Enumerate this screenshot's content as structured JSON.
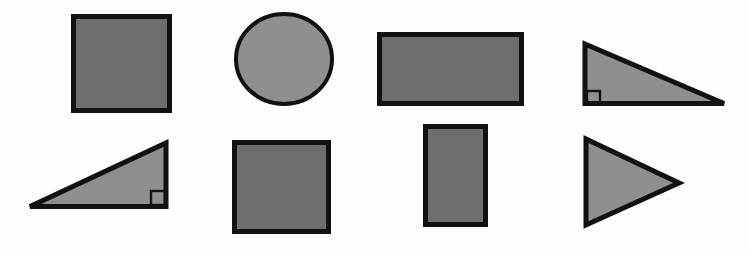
{
  "figure": {
    "background_color": "#fdfdfc",
    "outline_color": "#111111",
    "fill_color_dark": "#6e6e6e",
    "fill_color_light": "#8f8f8f",
    "rows": 2,
    "columns": 4,
    "shape_count": 8
  },
  "shapes": [
    {
      "id": "shape-1",
      "name": "square",
      "label": "Square",
      "row": 1,
      "column": 1,
      "fill": "#6e6e6e",
      "stroke": "#111111",
      "stroke_width": 5,
      "geometry": {
        "x": 71,
        "y": 14,
        "width": 101,
        "height": 99
      },
      "right_angle_marker": false
    },
    {
      "id": "shape-2",
      "name": "circle",
      "label": "Circle",
      "row": 1,
      "column": 2,
      "fill": "#8f8f8f",
      "stroke": "#111111",
      "stroke_width": 4,
      "geometry": {
        "cx": 284,
        "cy": 59,
        "rx": 50,
        "ry": 47
      },
      "right_angle_marker": false
    },
    {
      "id": "shape-3",
      "name": "rectangle-landscape",
      "label": "Rectangle",
      "row": 1,
      "column": 3,
      "fill": "#6e6e6e",
      "stroke": "#111111",
      "stroke_width": 5,
      "geometry": {
        "x": 377,
        "y": 32,
        "width": 147,
        "height": 74
      },
      "right_angle_marker": false
    },
    {
      "id": "shape-4",
      "name": "right-triangle-down-right",
      "label": "Right triangle",
      "row": 1,
      "column": 4,
      "fill": "#8f8f8f",
      "stroke": "#111111",
      "stroke_width": 5,
      "geometry": {
        "points": "584,42 584,105 727,105"
      },
      "right_angle_marker": true,
      "right_angle_corner": "bottom-left",
      "marker_geometry": {
        "x": 586,
        "y": 92,
        "width": 13,
        "height": 13
      }
    },
    {
      "id": "shape-5",
      "name": "right-triangle-up-right",
      "label": "Right triangle",
      "row": 2,
      "column": 1,
      "fill": "#8f8f8f",
      "stroke": "#111111",
      "stroke_width": 5,
      "geometry": {
        "points": "28,208 168,141 168,208"
      },
      "right_angle_marker": true,
      "right_angle_corner": "bottom-right",
      "marker_geometry": {
        "x": 152,
        "y": 192,
        "width": 14,
        "height": 14
      }
    },
    {
      "id": "shape-6",
      "name": "square-lower",
      "label": "Square",
      "row": 2,
      "column": 2,
      "fill": "#6e6e6e",
      "stroke": "#111111",
      "stroke_width": 5,
      "geometry": {
        "x": 232,
        "y": 140,
        "width": 99,
        "height": 94
      },
      "right_angle_marker": false
    },
    {
      "id": "shape-7",
      "name": "rectangle-portrait",
      "label": "Rectangle",
      "row": 2,
      "column": 3,
      "fill": "#6e6e6e",
      "stroke": "#111111",
      "stroke_width": 5,
      "geometry": {
        "x": 423,
        "y": 124,
        "width": 65,
        "height": 103
      },
      "right_angle_marker": false
    },
    {
      "id": "shape-8",
      "name": "triangle-pointing-right",
      "label": "Triangle",
      "row": 2,
      "column": 4,
      "fill": "#8f8f8f",
      "stroke": "#111111",
      "stroke_width": 5,
      "geometry": {
        "points": "584,136 682,183 584,228"
      },
      "right_angle_marker": false
    }
  ]
}
